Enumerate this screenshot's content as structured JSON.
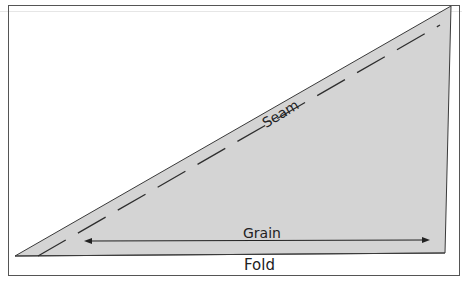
{
  "diagram": {
    "type": "sewing-pattern-piece",
    "shape": "right-triangle-pattern",
    "labels": {
      "seam": "Seam",
      "grain": "Grain",
      "fold": "Fold"
    },
    "colors": {
      "piece_fill": "#d4d4d4",
      "stroke": "#3a3a3a",
      "frame": "#555555",
      "background": "#ffffff"
    },
    "elements": [
      {
        "name": "pattern-piece",
        "description": "light gray triangle pattern piece"
      },
      {
        "name": "seam-line",
        "style": "dashed",
        "description": "seam allowance line parallel to the hypotenuse"
      },
      {
        "name": "grain-arrow",
        "style": "double-headed arrow",
        "description": "grainline parallel to fold"
      },
      {
        "name": "fold-edge",
        "description": "bottom edge placed on fold"
      }
    ]
  }
}
